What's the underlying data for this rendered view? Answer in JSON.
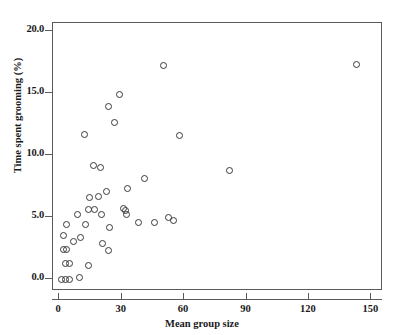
{
  "chart_data": {
    "type": "scatter",
    "title": "",
    "xlabel": "Mean group size",
    "ylabel": "Time spent grooming (%)",
    "xlim": [
      -3,
      155.6
    ],
    "ylim": [
      -0.95,
      20.65
    ],
    "xticks": [
      0,
      30,
      60,
      90,
      120,
      150
    ],
    "xtick_labels": [
      "0",
      "30",
      "60",
      "90",
      "120",
      "150"
    ],
    "yticks": [
      0.0,
      5.0,
      10.0,
      15.0,
      20.0
    ],
    "ytick_labels": [
      "0.0",
      "5.0",
      "10.0",
      "15.0",
      "20.0"
    ],
    "grid": false,
    "legend": null,
    "marker": "open-circle",
    "marker_color": "#3a3a3a",
    "frame_color": "#5a5a5a",
    "points": [
      {
        "x": 1.0,
        "y": 0.0
      },
      {
        "x": 3.0,
        "y": 0.0
      },
      {
        "x": 5.0,
        "y": 0.0
      },
      {
        "x": 9.5,
        "y": 0.1
      },
      {
        "x": 3.0,
        "y": 1.3
      },
      {
        "x": 5.0,
        "y": 1.3
      },
      {
        "x": 14.0,
        "y": 1.1
      },
      {
        "x": 2.0,
        "y": 2.4
      },
      {
        "x": 3.5,
        "y": 2.4
      },
      {
        "x": 2.0,
        "y": 3.5
      },
      {
        "x": 10.0,
        "y": 3.4
      },
      {
        "x": 7.0,
        "y": 3.0
      },
      {
        "x": 21.0,
        "y": 2.9
      },
      {
        "x": 23.5,
        "y": 2.3
      },
      {
        "x": 3.5,
        "y": 4.4
      },
      {
        "x": 12.5,
        "y": 4.4
      },
      {
        "x": 9.0,
        "y": 5.2
      },
      {
        "x": 14.0,
        "y": 5.6
      },
      {
        "x": 17.0,
        "y": 5.6
      },
      {
        "x": 20.5,
        "y": 5.2
      },
      {
        "x": 31.0,
        "y": 5.7
      },
      {
        "x": 32.0,
        "y": 5.5
      },
      {
        "x": 32.5,
        "y": 5.2
      },
      {
        "x": 38.0,
        "y": 4.6
      },
      {
        "x": 46.0,
        "y": 4.6
      },
      {
        "x": 52.5,
        "y": 5.0
      },
      {
        "x": 55.0,
        "y": 4.7
      },
      {
        "x": 24.0,
        "y": 4.2
      },
      {
        "x": 14.5,
        "y": 6.6
      },
      {
        "x": 19.0,
        "y": 6.7
      },
      {
        "x": 22.5,
        "y": 7.1
      },
      {
        "x": 33.0,
        "y": 7.3
      },
      {
        "x": 16.5,
        "y": 9.2
      },
      {
        "x": 41.0,
        "y": 8.1
      },
      {
        "x": 82.0,
        "y": 8.8
      },
      {
        "x": 20.0,
        "y": 9.0
      },
      {
        "x": 12.0,
        "y": 11.7
      },
      {
        "x": 58.0,
        "y": 11.6
      },
      {
        "x": 26.5,
        "y": 12.6
      },
      {
        "x": 23.5,
        "y": 13.9
      },
      {
        "x": 29.0,
        "y": 14.9
      },
      {
        "x": 50.0,
        "y": 17.2
      },
      {
        "x": 143.0,
        "y": 17.3
      }
    ]
  }
}
